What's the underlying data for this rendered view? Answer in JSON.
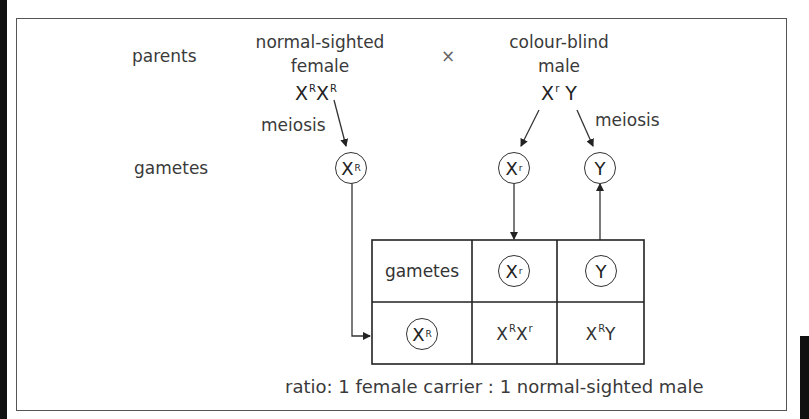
{
  "diagram": {
    "row_labels": {
      "parents": "parents",
      "gametes": "gametes"
    },
    "cross_symbol": "×",
    "female": {
      "line1": "normal-sighted",
      "line2": "female",
      "genotype": {
        "a_base": "X",
        "a_sup": "R",
        "b_base": "X",
        "b_sup": "R"
      },
      "meiosis_label": "meiosis",
      "gamete": {
        "base": "X",
        "sup": "R"
      }
    },
    "male": {
      "line1": "colour-blind",
      "line2": "male",
      "genotype": {
        "a_base": "X",
        "a_sup": "r",
        "b_base": "Y"
      },
      "meiosis_label": "meiosis",
      "gametes": [
        {
          "base": "X",
          "sup": "r"
        },
        {
          "base": "Y",
          "sup": ""
        }
      ]
    },
    "punnett": {
      "header_label": "gametes",
      "col_gametes": [
        {
          "base": "X",
          "sup": "r"
        },
        {
          "base": "Y",
          "sup": ""
        }
      ],
      "row_gamete": {
        "base": "X",
        "sup": "R"
      },
      "offspring": [
        {
          "a_base": "X",
          "a_sup": "R",
          "b_base": "X",
          "b_sup": "r"
        },
        {
          "a_base": "X",
          "a_sup": "R",
          "b_base": "Y",
          "b_sup": ""
        }
      ]
    },
    "ratio_text": "ratio: 1 female carrier : 1 normal-sighted male"
  },
  "colors": {
    "line": "#333333",
    "text": "#333333",
    "frame": "#555555",
    "side_bars": "#111111"
  }
}
